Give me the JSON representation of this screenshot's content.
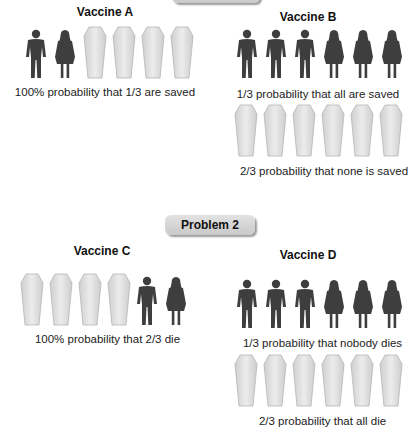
{
  "problems": [
    {
      "label": "Problem 1",
      "vaccines": [
        {
          "title": "Vaccine A",
          "outcomes": [
            {
              "figures": [
                "man",
                "woman",
                "coffin",
                "coffin",
                "coffin",
                "coffin"
              ],
              "caption": "100% probability that 1/3 are saved"
            }
          ]
        },
        {
          "title": "Vaccine B",
          "outcomes": [
            {
              "figures": [
                "man",
                "man",
                "man",
                "woman",
                "woman",
                "woman"
              ],
              "caption": "1/3 probability that all are saved"
            },
            {
              "figures": [
                "coffin",
                "coffin",
                "coffin",
                "coffin",
                "coffin",
                "coffin"
              ],
              "caption": "2/3 probability that none is saved"
            }
          ]
        }
      ]
    },
    {
      "label": "Problem 2",
      "vaccines": [
        {
          "title": "Vaccine C",
          "outcomes": [
            {
              "figures": [
                "coffin",
                "coffin",
                "coffin",
                "coffin",
                "man",
                "woman"
              ],
              "caption": "100% probability that 2/3 die"
            }
          ]
        },
        {
          "title": "Vaccine D",
          "outcomes": [
            {
              "figures": [
                "man",
                "man",
                "man",
                "woman",
                "woman",
                "woman"
              ],
              "caption": "1/3 probability that nobody dies"
            },
            {
              "figures": [
                "coffin",
                "coffin",
                "coffin",
                "coffin",
                "coffin",
                "coffin"
              ],
              "caption": "2/3 probability that all die"
            }
          ]
        }
      ]
    }
  ],
  "colors": {
    "person": "#3e3e3e",
    "coffin_fill": "#dedede",
    "coffin_stroke": "#b5b5b5",
    "banner": "#d4d4d4"
  }
}
